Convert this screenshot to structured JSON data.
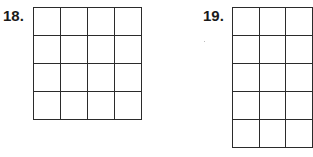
{
  "problems": [
    {
      "number": "18.",
      "rows": 4,
      "cols": 4
    },
    {
      "number": "19.",
      "rows": 5,
      "cols": 3,
      "note": "grid continues beyond right edge"
    }
  ],
  "colors": {
    "grid_line": "#2b2b2b",
    "label": "#1a1a1a",
    "background": "#ffffff"
  }
}
